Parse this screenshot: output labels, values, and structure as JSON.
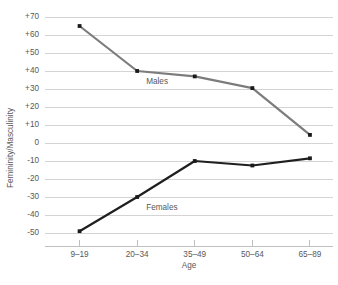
{
  "chart_data": {
    "type": "line",
    "title": "",
    "xlabel": "Age",
    "ylabel": "Femininity/Masculinity",
    "categories": [
      "9–19",
      "20–34",
      "35–49",
      "50–64",
      "65–89"
    ],
    "ylim": [
      -50,
      70
    ],
    "yticks": [
      70,
      60,
      50,
      40,
      30,
      20,
      10,
      0,
      -10,
      -20,
      -30,
      -40,
      -50
    ],
    "ytick_labels": [
      "+70",
      "+60",
      "+50",
      "+40",
      "+30",
      "+20",
      "+10",
      "0",
      "-10",
      "-20",
      "-30",
      "-40",
      "-50"
    ],
    "grid": true,
    "grid_axis": "y",
    "legend_position": "inline-annotation",
    "series": [
      {
        "name": "Males",
        "color": "#7c7c7c",
        "marker": "square",
        "marker_color": "#1a1a1a",
        "values": [
          65,
          40,
          37,
          30.5,
          4.5
        ],
        "label_x_category": "20–34",
        "label_text": "Males"
      },
      {
        "name": "Females",
        "color": "#1f1f1f",
        "marker": "square",
        "marker_color": "#1a1a1a",
        "values": [
          -49,
          -30,
          -10,
          -12.5,
          -8.5
        ],
        "label_x_category": "20–34",
        "label_text": "Females"
      }
    ]
  },
  "axis": {
    "y_title": "Femininity/Masculinity",
    "x_title": "Age"
  },
  "annotations": {
    "males_label": "Males",
    "females_label": "Females"
  },
  "colors": {
    "background": "#ffffff",
    "gridline": "#c9c9c9",
    "axis": "#b0b0b0",
    "text": "#58585a",
    "males_line": "#7c7c7c",
    "females_line": "#1f1f1f",
    "marker": "#1a1a1a"
  }
}
